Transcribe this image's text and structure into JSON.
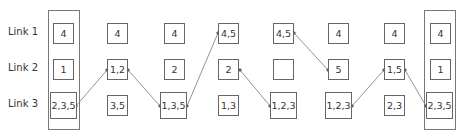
{
  "rows": [
    {
      "label": "Link 1"
    },
    {
      "label": "Link 2"
    },
    {
      "label": "Link 3"
    }
  ],
  "columns": [
    {
      "cells": [
        "4",
        "1",
        "2,3,5"
      ],
      "framed": true
    },
    {
      "cells": [
        "4",
        "1,2",
        "3,5"
      ],
      "framed": false
    },
    {
      "cells": [
        "4",
        "2",
        "1,3,5"
      ],
      "framed": false
    },
    {
      "cells": [
        "4,5",
        "2",
        "1,3"
      ],
      "framed": false
    },
    {
      "cells": [
        "4,5",
        "",
        "1,2,3"
      ],
      "framed": false
    },
    {
      "cells": [
        "4",
        "5",
        "1,2,3"
      ],
      "framed": false
    },
    {
      "cells": [
        "4",
        "1,5",
        "2,3"
      ],
      "framed": false
    },
    {
      "cells": [
        "4",
        "1",
        "2,3,5"
      ],
      "framed": true
    }
  ],
  "path": [
    {
      "col": 0,
      "row": 2
    },
    {
      "col": 1,
      "row": 1
    },
    {
      "col": 2,
      "row": 2
    },
    {
      "col": 3,
      "row": 0
    },
    {
      "col": 4,
      "row": 0
    },
    {
      "col": 5,
      "row": 1
    },
    {
      "col": 6,
      "row": 2
    },
    {
      "col": 6,
      "row": 1
    },
    {
      "col": 7,
      "row": 2
    }
  ],
  "colors": {
    "line": "#777777",
    "border": "#666666",
    "text": "#333333"
  }
}
